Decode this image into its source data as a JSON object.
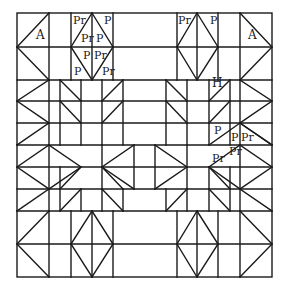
{
  "diagram": {
    "line_color": "#1a1a1a",
    "background": "#ffffff",
    "frame": {
      "x1": 17,
      "y1": 13,
      "x2": 272,
      "y2": 277
    }
  },
  "labels": [
    {
      "text": "A",
      "x": 36,
      "y": 39,
      "size": "big",
      "region": "top-left-corner"
    },
    {
      "text": "Pr",
      "x": 73,
      "y": 24,
      "region": "top-left-diamond"
    },
    {
      "text": "P",
      "x": 104,
      "y": 24,
      "region": "top-left-diamond"
    },
    {
      "text": "Pr",
      "x": 81,
      "y": 42,
      "region": "top-left-diamond"
    },
    {
      "text": "P",
      "x": 96,
      "y": 42,
      "region": "top-left-diamond"
    },
    {
      "text": "P",
      "x": 83,
      "y": 59,
      "region": "top-left-diamond"
    },
    {
      "text": "Pr",
      "x": 94,
      "y": 59,
      "region": "top-left-diamond"
    },
    {
      "text": "P",
      "x": 74,
      "y": 75,
      "region": "top-left-diamond"
    },
    {
      "text": "Pr",
      "x": 102,
      "y": 75,
      "region": "top-left-diamond"
    },
    {
      "text": "Pr",
      "x": 178,
      "y": 24,
      "region": "top-right-diamond"
    },
    {
      "text": "P",
      "x": 210,
      "y": 24,
      "region": "top-right-diamond"
    },
    {
      "text": "A",
      "x": 248,
      "y": 39,
      "size": "big",
      "region": "top-right-corner"
    },
    {
      "text": "H",
      "x": 212,
      "y": 87,
      "size": "big",
      "region": "right-hourglass"
    },
    {
      "text": "P",
      "x": 214,
      "y": 134,
      "region": "right-star-point"
    },
    {
      "text": "P",
      "x": 231,
      "y": 141,
      "region": "right-star-point"
    },
    {
      "text": "Pr",
      "x": 241,
      "y": 141,
      "region": "right-star-point"
    },
    {
      "text": "Pr",
      "x": 229,
      "y": 155,
      "region": "right-star-point"
    },
    {
      "text": "Pr",
      "x": 212,
      "y": 162,
      "region": "right-star-point"
    }
  ]
}
